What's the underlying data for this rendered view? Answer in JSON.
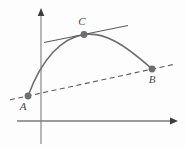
{
  "figure": {
    "type": "math-diagram",
    "background_color": "#fdfdfd",
    "axes": {
      "x_axis": {
        "name": "x-axis",
        "color": "#3d3d3d",
        "stroke_width": 1.1,
        "x1": 17,
        "y1": 121,
        "x2": 172,
        "y2": 121,
        "arrow": "right",
        "arrow_tip_x": 177,
        "arrow_tip_y": 121
      },
      "y_axis": {
        "name": "y-axis",
        "color": "#7d7d7d",
        "stroke_width": 1.1,
        "x1": 41,
        "y1": 144,
        "x2": 41,
        "y2": 15,
        "arrow": "up",
        "arrow_tip_x": 41,
        "arrow_tip_y": 9
      }
    },
    "curve": {
      "name": "parabolic-curve",
      "color": "#6e6e6e",
      "stroke_width": 1.6,
      "path": "M 28 96 C 42 58, 62 38, 84 34.5 C 104 31.5, 124 44, 152 69",
      "endpoints": [
        "A",
        "B"
      ],
      "shape": "concave-down arc"
    },
    "secant_line": {
      "name": "secant-dashed-line",
      "color": "#5c5c5c",
      "stroke_width": 1.1,
      "dash_pattern": "5,3.5",
      "x1": 10,
      "y1": 99.8,
      "x2": 173,
      "y2": 64.6,
      "through_points": [
        "A",
        "B"
      ]
    },
    "tangent_line": {
      "name": "tangent-line-at-C",
      "color": "#5c5c5c",
      "stroke_width": 1.1,
      "x1": 44,
      "y1": 42.5,
      "x2": 128,
      "y2": 25.5,
      "touches_point": "C"
    },
    "points": [
      {
        "id": "A",
        "label": "A",
        "cx": 28,
        "cy": 96,
        "r": 3.4,
        "fill": "#6e6e6e",
        "label_x": 23,
        "label_y": 107
      },
      {
        "id": "C",
        "label": "C",
        "cx": 84,
        "cy": 34.5,
        "r": 3.4,
        "fill": "#6e6e6e",
        "label_x": 82,
        "label_y": 22
      },
      {
        "id": "B",
        "label": "B",
        "cx": 152,
        "cy": 69,
        "r": 3.4,
        "fill": "#6e6e6e",
        "label_x": 152,
        "label_y": 80
      }
    ]
  }
}
